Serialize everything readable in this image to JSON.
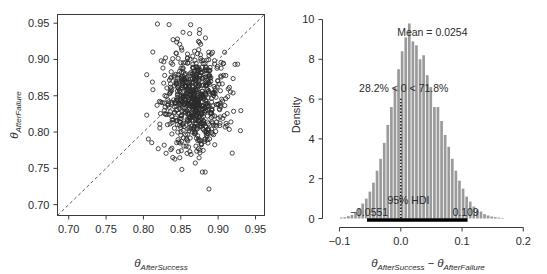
{
  "figure": {
    "title": "",
    "panels": [
      "scatter-panel",
      "histogram-panel"
    ]
  },
  "labels": {
    "theta": "θ",
    "sub_after_success": "AfterSuccess",
    "sub_after_failure": "AfterFailure",
    "minus": "−",
    "density": "Density"
  },
  "annotations": {
    "mean": "Mean = 0.0254",
    "compare": "28.2% < 0 < 71.8%",
    "hdi_label": "95% HDI",
    "hdi_low": "−0.0551",
    "hdi_high": "0.109"
  },
  "chart_data": [
    {
      "type": "scatter",
      "name": "scatter-panel",
      "title": "",
      "xlabel": "θ_AfterSuccess",
      "ylabel": "θ_AfterFailure",
      "xlim": [
        0.685,
        0.962
      ],
      "ylim": [
        0.685,
        0.962
      ],
      "xticks": [
        0.7,
        0.75,
        0.8,
        0.85,
        0.9,
        0.95
      ],
      "yticks": [
        0.7,
        0.75,
        0.8,
        0.85,
        0.9,
        0.95
      ],
      "xticklabels": [
        "0.70",
        "0.75",
        "0.80",
        "0.85",
        "0.90",
        "0.95"
      ],
      "yticklabels": [
        "0.70",
        "0.75",
        "0.80",
        "0.85",
        "0.90",
        "0.95"
      ],
      "grid": false,
      "legend": "none",
      "marker": "open-circle",
      "n_points": 700,
      "point_cloud": {
        "x_mean": 0.868,
        "x_sd": 0.021,
        "y_mean": 0.843,
        "y_sd": 0.034,
        "correlation": 0.05
      },
      "reference_line": {
        "type": "identity",
        "style": "dashed",
        "from": [
          0.685,
          0.685
        ],
        "to": [
          0.962,
          0.962
        ]
      }
    },
    {
      "type": "bar",
      "name": "histogram-panel",
      "title": "",
      "xlabel": "θ_AfterSuccess − θ_AfterFailure",
      "ylabel": "Density",
      "xlim": [
        -0.118,
        0.215
      ],
      "ylim": [
        0,
        10.25
      ],
      "xticks": [
        -0.1,
        0.0,
        0.1,
        0.2
      ],
      "yticks": [
        0,
        2,
        4,
        6,
        8,
        10
      ],
      "xticklabels": [
        "−0.1",
        "0.0",
        "0.1",
        "0.2"
      ],
      "yticklabels": [
        "0",
        "2",
        "4",
        "6",
        "8",
        "10"
      ],
      "grid": false,
      "legend": "none",
      "bin_width": 0.00585,
      "bin_centers": [
        -0.0965,
        -0.0907,
        -0.0848,
        -0.079,
        -0.0731,
        -0.0673,
        -0.0614,
        -0.0556,
        -0.0497,
        -0.0439,
        -0.038,
        -0.0322,
        -0.0263,
        -0.0205,
        -0.0146,
        -0.0088,
        -0.0029,
        0.0029,
        0.0088,
        0.0146,
        0.0205,
        0.0263,
        0.0322,
        0.038,
        0.0439,
        0.0497,
        0.0556,
        0.0614,
        0.0673,
        0.0731,
        0.079,
        0.0848,
        0.0907,
        0.0965,
        0.1024,
        0.1082,
        0.1141,
        0.1199,
        0.1258,
        0.1316,
        0.1375,
        0.1433,
        0.1492,
        0.155,
        0.1609,
        0.1667
      ],
      "values": [
        0.05,
        0.07,
        0.12,
        0.18,
        0.3,
        0.5,
        0.75,
        1.0,
        1.35,
        1.8,
        2.4,
        3.0,
        3.8,
        4.7,
        5.6,
        6.6,
        7.5,
        8.4,
        9.1,
        9.8,
        8.9,
        8.7,
        8.0,
        8.2,
        7.2,
        6.6,
        5.6,
        5.6,
        4.9,
        4.2,
        3.6,
        3.0,
        2.4,
        1.9,
        1.5,
        1.1,
        0.85,
        0.6,
        0.45,
        0.35,
        0.22,
        0.15,
        0.1,
        0.07,
        0.05,
        0.03
      ],
      "mean": 0.0254,
      "pct_below_zero": 28.2,
      "pct_above_zero": 71.8,
      "hdi": {
        "level": 95,
        "low": -0.0551,
        "high": 0.109
      },
      "zero_reference": 0.0
    }
  ]
}
